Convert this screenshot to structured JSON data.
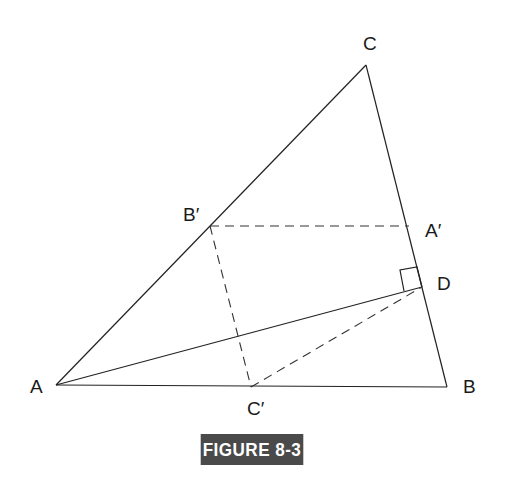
{
  "figure": {
    "caption": "FIGURE 8-3",
    "badge_color": "#4a4a4a"
  },
  "points": {
    "A": {
      "label": "A",
      "x": 56,
      "y": 385
    },
    "B": {
      "label": "B",
      "x": 447,
      "y": 387
    },
    "C": {
      "label": "C",
      "x": 366,
      "y": 65
    },
    "A_prime": {
      "label": "A′",
      "x": 409,
      "y": 226
    },
    "B_prime": {
      "label": "B′",
      "x": 210,
      "y": 226
    },
    "C_prime": {
      "label": "C′",
      "x": 251,
      "y": 387
    },
    "D": {
      "label": "D",
      "x": 422,
      "y": 287
    }
  },
  "segments": {
    "solid": [
      "AB",
      "BC",
      "CA",
      "AD"
    ],
    "dashed": [
      "B′A′",
      "B′C′",
      "C′D"
    ]
  },
  "annotations": {
    "right_angle_at": "D",
    "right_angle_between": [
      "AD",
      "BC"
    ]
  }
}
